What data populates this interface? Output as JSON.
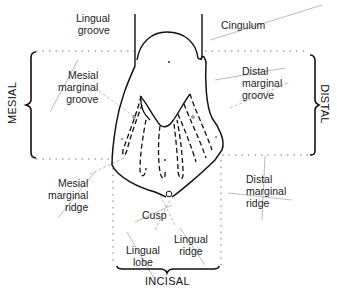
{
  "diagram": {
    "directions": {
      "mesial": "MESIAL",
      "distal": "DISTAL",
      "incisal": "INCISAL"
    },
    "labels": {
      "lingual_groove": "Lingual\ngroove",
      "cingulum": "Cingulum",
      "mesial_marginal_groove": "Mesial\nmarginal\ngroove",
      "distal_marginal_groove": "Distal\nmarginal\ngroove",
      "mesial_marginal_ridge": "Mesial\nmarginal\nridge",
      "distal_marginal_ridge": "Distal\nmarginal\nridge",
      "cusp": "Cusp",
      "lingual_lobe": "Lingual\nlobe",
      "lingual_ridge": "Lingual\nridge"
    },
    "colors": {
      "outline": "#111111",
      "leader": "#b0b0b0",
      "dotted_guide": "#666666",
      "text": "#222222"
    }
  }
}
